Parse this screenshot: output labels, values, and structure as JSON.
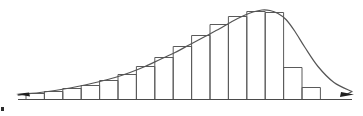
{
  "figure": {
    "title": "",
    "background_color": "#ffffff",
    "axis": {
      "baseline_y": 99.5,
      "x_start": 18,
      "x_end": 352,
      "color": "#4a4a4a",
      "stroke_width": 1.1,
      "left_arrow": "left-arrow-head",
      "right_arrow": "right-arrow-head"
    },
    "curve": {
      "color": "#555555",
      "stroke_width": 1.2,
      "label": "smooth-density-curve"
    },
    "bars": {
      "color": "#5a5a5a",
      "stroke_width": 1.0,
      "fill": "none"
    },
    "corner_mark": "corner-speck"
  },
  "chart_data": {
    "type": "bar",
    "title": "",
    "subtitle": "",
    "xlabel": "",
    "ylabel": "",
    "grid": false,
    "legend": null,
    "annotations": [
      "horizontal axis with arrowheads at both ends",
      "smooth unimodal density curve overlaid on histogram",
      "distribution is negatively skewed with a long left tail and steep right drop"
    ],
    "axis_ranges": {
      "xlim": [
        0,
        16
      ],
      "ylim": [
        0,
        92
      ]
    },
    "bar_geometry": {
      "left_edge_px": 26,
      "bar_width_px": 18.4,
      "baseline_px": 99.5,
      "note": "bar i spans x = left_edge + i*bar_width; top y = baseline - value"
    },
    "categories": [
      "1",
      "2",
      "3",
      "4",
      "5",
      "6",
      "7",
      "8",
      "9",
      "10",
      "11",
      "12",
      "13",
      "14",
      "15",
      "16"
    ],
    "values": [
      6,
      8,
      11,
      14,
      19,
      25,
      33,
      42,
      53,
      64,
      75,
      83,
      88,
      87,
      32,
      12
    ],
    "curve_points": {
      "x": [
        18,
        26,
        40,
        55,
        70,
        85,
        100,
        115,
        130,
        145,
        160,
        175,
        190,
        205,
        220,
        232,
        244,
        253,
        262,
        270,
        278,
        286,
        295,
        305,
        318,
        334,
        352
      ],
      "y": [
        4.5,
        5.5,
        7,
        9,
        11.5,
        14.5,
        18,
        22,
        27,
        33,
        40,
        47,
        55,
        63,
        71,
        78,
        84,
        87.5,
        89.5,
        89,
        86,
        80,
        68,
        52,
        33,
        17,
        8
      ],
      "note": "y values are heights above the baseline in pixels"
    }
  }
}
